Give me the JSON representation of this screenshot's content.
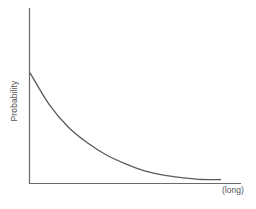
{
  "chart_data": {
    "type": "line",
    "title": "",
    "xlabel": "(long)",
    "ylabel": "Probability",
    "grid": false,
    "legend": null,
    "series": [
      {
        "name": "probability",
        "x": [
          0,
          0.1,
          0.2,
          0.3,
          0.4,
          0.5,
          0.6,
          0.7,
          0.8,
          0.9,
          1.0
        ],
        "values": [
          0.63,
          0.45,
          0.32,
          0.23,
          0.16,
          0.11,
          0.07,
          0.045,
          0.03,
          0.02,
          0.02
        ]
      }
    ],
    "xlim": [
      0,
      1
    ],
    "ylim": [
      0,
      1
    ],
    "x_ticks": [],
    "y_ticks": []
  },
  "colors": {
    "axis": "#6a6a6a",
    "curve": "#5a5a5a",
    "text": "#555555",
    "background": "#ffffff"
  }
}
